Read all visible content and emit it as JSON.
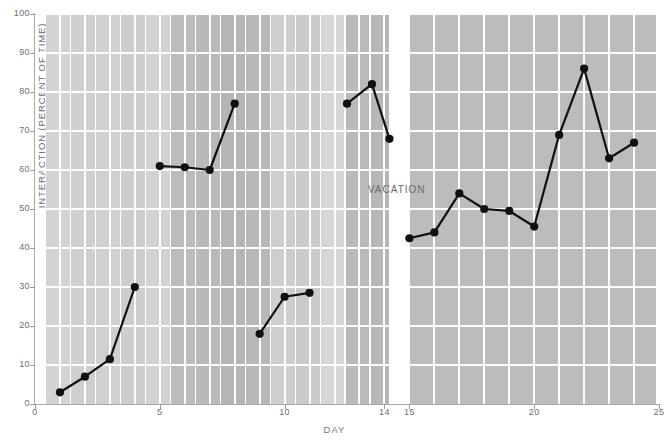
{
  "chart_data": {
    "type": "line",
    "title": "",
    "xlabel": "DAY",
    "ylabel": "INTERACTION (PERCENT OF TIME)",
    "xlim": [
      0,
      25
    ],
    "ylim": [
      0,
      100
    ],
    "grid": true,
    "legend": null,
    "y_ticks": [
      0,
      10,
      20,
      30,
      40,
      50,
      60,
      70,
      80,
      90,
      100
    ],
    "x_ticks": [
      0,
      5,
      10,
      14,
      15,
      20,
      25
    ],
    "annotations": [
      {
        "text": "VACATION",
        "x": 14.5,
        "y": 55
      }
    ],
    "series": [
      {
        "name": "interaction",
        "marker": "filled-circle",
        "color": "#111111",
        "segments": [
          {
            "x": [
              1,
              2,
              3,
              4
            ],
            "values": [
              3,
              7,
              11.5,
              30
            ]
          },
          {
            "x": [
              5,
              6,
              7,
              8
            ],
            "values": [
              61,
              60.7,
              60,
              77
            ]
          },
          {
            "x": [
              9,
              10,
              11
            ],
            "values": [
              18,
              27.5,
              28.5
            ]
          },
          {
            "x": [
              12.5,
              13.5,
              14.2
            ],
            "values": [
              77,
              82,
              68
            ]
          },
          {
            "x": [
              15,
              16,
              17,
              18,
              19,
              20,
              21,
              22,
              23,
              24
            ],
            "values": [
              42.5,
              44,
              54,
              50,
              49.5,
              45.5,
              69,
              86,
              63,
              67
            ]
          }
        ]
      }
    ]
  },
  "background": {
    "gap_start": 14.2,
    "gap_end": 15.0,
    "bands": [
      {
        "x0": 0.45,
        "x1": 1.4,
        "shade": "#d3d3d3"
      },
      {
        "x0": 1.45,
        "x1": 2.4,
        "shade": "#cfcfcf"
      },
      {
        "x0": 2.45,
        "x1": 3.4,
        "shade": "#d0d0d0"
      },
      {
        "x0": 3.45,
        "x1": 4.4,
        "shade": "#cdcdcd"
      },
      {
        "x0": 4.45,
        "x1": 5.4,
        "shade": "#d2d2d2"
      },
      {
        "x0": 5.45,
        "x1": 6.4,
        "shade": "#bcbcbc"
      },
      {
        "x0": 6.45,
        "x1": 7.4,
        "shade": "#b9b9b9"
      },
      {
        "x0": 7.45,
        "x1": 8.4,
        "shade": "#b5b5b5"
      },
      {
        "x0": 8.45,
        "x1": 9.4,
        "shade": "#b8b8b8"
      },
      {
        "x0": 9.45,
        "x1": 10.4,
        "shade": "#cecece"
      },
      {
        "x0": 10.45,
        "x1": 11.4,
        "shade": "#cbcbcb"
      },
      {
        "x0": 11.45,
        "x1": 12.4,
        "shade": "#d6d6d6"
      },
      {
        "x0": 12.45,
        "x1": 13.4,
        "shade": "#bababa"
      },
      {
        "x0": 13.45,
        "x1": 14.2,
        "shade": "#b7b7b7"
      },
      {
        "x0": 15.0,
        "x1": 15.95,
        "shade": "#bcbcbc"
      },
      {
        "x0": 16.0,
        "x1": 16.95,
        "shade": "#bcbcbc"
      },
      {
        "x0": 17.0,
        "x1": 17.95,
        "shade": "#bcbcbc"
      },
      {
        "x0": 18.0,
        "x1": 18.95,
        "shade": "#bcbcbc"
      },
      {
        "x0": 19.0,
        "x1": 19.95,
        "shade": "#bcbcbc"
      },
      {
        "x0": 20.0,
        "x1": 20.95,
        "shade": "#bcbcbc"
      },
      {
        "x0": 21.0,
        "x1": 21.95,
        "shade": "#bcbcbc"
      },
      {
        "x0": 22.0,
        "x1": 22.95,
        "shade": "#bcbcbc"
      },
      {
        "x0": 23.0,
        "x1": 23.95,
        "shade": "#bcbcbc"
      },
      {
        "x0": 24.0,
        "x1": 24.9,
        "shade": "#bcbcbc"
      }
    ]
  },
  "footnote": {
    "text": ""
  }
}
